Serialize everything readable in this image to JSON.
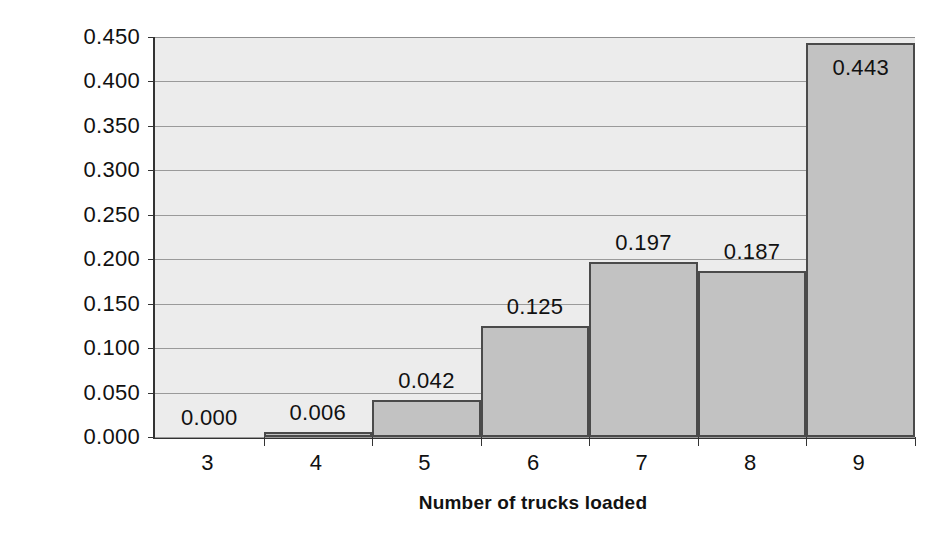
{
  "chart_data": {
    "type": "bar",
    "title": "",
    "xlabel": "Number of trucks loaded",
    "ylabel": "Probability",
    "categories": [
      "3",
      "4",
      "5",
      "6",
      "7",
      "8",
      "9"
    ],
    "values": [
      0.0,
      0.006,
      0.042,
      0.125,
      0.197,
      0.187,
      0.443
    ],
    "value_labels": [
      "0.000",
      "0.006",
      "0.042",
      "0.125",
      "0.197",
      "0.187",
      "0.443"
    ],
    "label_positions": [
      "outside",
      "outside",
      "outside",
      "outside",
      "outside",
      "outside",
      "inside"
    ],
    "ylim": [
      0.0,
      0.45
    ],
    "ytick_values": [
      0.0,
      0.05,
      0.1,
      0.15,
      0.2,
      0.25,
      0.3,
      0.35,
      0.4,
      0.45
    ],
    "ytick_labels": [
      "0.000",
      "0.050",
      "0.100",
      "0.150",
      "0.200",
      "0.250",
      "0.300",
      "0.350",
      "0.400",
      "0.450"
    ],
    "grid": true,
    "grid_axis": "y",
    "legend": false,
    "bar_gap": 0,
    "colors": {
      "bar_fill": "#c2c2c2",
      "bar_border": "#4a4a4a",
      "plot_background": "#ececec",
      "grid_line": "#9a9a9a",
      "axis_line": "#333333",
      "text": "#111111",
      "figure_background": "#ffffff"
    }
  },
  "bottom_caption": ""
}
